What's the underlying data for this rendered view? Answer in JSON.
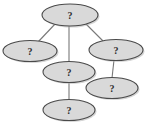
{
  "diagram": {
    "type": "node-link-graph",
    "title": "",
    "background_color": "#ffffff",
    "node_fill_color": "#d9d9d9",
    "node_stroke_color": "#4a4a4a",
    "edge_color": "#787878",
    "label_color": "#2b2b2b",
    "node_label_text": "?",
    "nodes": [
      {
        "id": "n1",
        "label": "?",
        "cx": 70,
        "cy": 15,
        "rx": 28,
        "ry": 11
      },
      {
        "id": "n2",
        "label": "?",
        "cx": 30,
        "cy": 51,
        "rx": 27,
        "ry": 10.5
      },
      {
        "id": "n3",
        "label": "?",
        "cx": 116,
        "cy": 50,
        "rx": 27,
        "ry": 10.5
      },
      {
        "id": "n4",
        "label": "?",
        "cx": 69,
        "cy": 72,
        "rx": 26,
        "ry": 10.5
      },
      {
        "id": "n5",
        "label": "?",
        "cx": 112,
        "cy": 88,
        "rx": 26,
        "ry": 10.5
      },
      {
        "id": "n6",
        "label": "?",
        "cx": 69,
        "cy": 110,
        "rx": 26,
        "ry": 10.5
      }
    ],
    "edges": [
      {
        "id": "e1",
        "from": "n1",
        "to": "n2",
        "x1": 56,
        "y1": 23,
        "x2": 38,
        "y2": 42
      },
      {
        "id": "e2",
        "from": "n1",
        "to": "n4",
        "x1": 69,
        "y1": 26,
        "x2": 69,
        "y2": 62
      },
      {
        "id": "e3",
        "from": "n1",
        "to": "n3",
        "x1": 85,
        "y1": 23,
        "x2": 103,
        "y2": 41
      },
      {
        "id": "e4",
        "from": "n3",
        "to": "n5",
        "x1": 114,
        "y1": 60,
        "x2": 112,
        "y2": 78
      },
      {
        "id": "e5",
        "from": "n4",
        "to": "n6",
        "x1": 69,
        "y1": 82,
        "x2": 69,
        "y2": 100
      }
    ]
  }
}
